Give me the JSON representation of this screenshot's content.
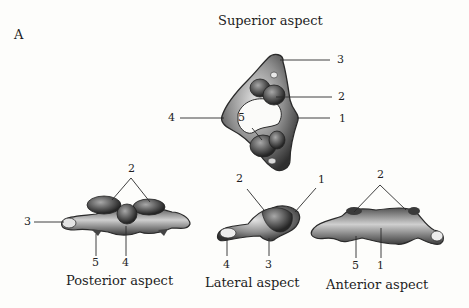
{
  "figure": {
    "panel_label": "A",
    "views": {
      "superior": {
        "title": "Superior aspect",
        "labels": [
          "3",
          "2",
          "4",
          "5",
          "1"
        ]
      },
      "posterior": {
        "title": "Posterior aspect",
        "labels": [
          "2",
          "3",
          "5",
          "4"
        ]
      },
      "lateral": {
        "title": "Lateral aspect",
        "labels": [
          "2",
          "1",
          "4",
          "3"
        ]
      },
      "anterior": {
        "title": "Anterior aspect",
        "labels": [
          "2",
          "5",
          "1"
        ]
      }
    }
  },
  "colors": {
    "bone_dark": "#3a3a3a",
    "bone_mid": "#7a7a7a",
    "bone_light": "#d6d6d6",
    "leader": "#2a2a2a",
    "background": "#fdfdfb"
  }
}
